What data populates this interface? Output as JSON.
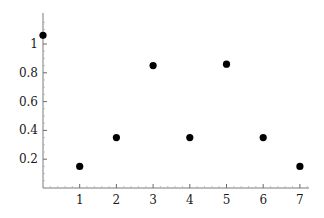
{
  "chart_data": {
    "type": "scatter",
    "title": "",
    "xlabel": "",
    "ylabel": "",
    "x": [
      0,
      1,
      2,
      3,
      4,
      5,
      6,
      7
    ],
    "series": [
      {
        "name": "points",
        "values": [
          1.06,
          0.15,
          0.35,
          0.85,
          0.35,
          0.86,
          0.35,
          0.15
        ],
        "color": "#000000"
      }
    ],
    "xlim": [
      0,
      7.25
    ],
    "ylim": [
      0,
      1.2
    ],
    "x_ticks": [
      1,
      2,
      3,
      4,
      5,
      6,
      7
    ],
    "x_tick_labels": [
      "1",
      "2",
      "3",
      "4",
      "5",
      "6",
      "7"
    ],
    "y_ticks": [
      0.2,
      0.4,
      0.6,
      0.8,
      1
    ],
    "y_tick_labels": [
      "0.2",
      "0.4",
      "0.6",
      "0.8",
      "1"
    ],
    "grid": false,
    "legend": "none"
  }
}
